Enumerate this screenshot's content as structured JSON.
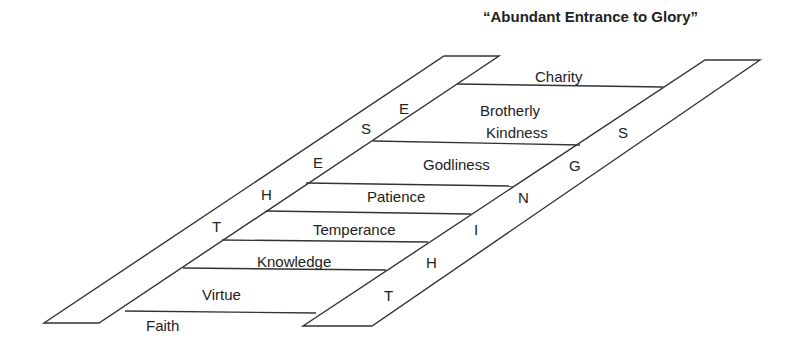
{
  "title": "“Abundant Entrance to Glory”",
  "rungs": {
    "faith": "Faith",
    "virtue": "Virtue",
    "knowledge": "Knowledge",
    "temperance": "Temperance",
    "patience": "Patience",
    "godliness": "Godliness",
    "brotherly_1": "Brotherly",
    "brotherly_2": "Kindness",
    "charity": "Charity"
  },
  "left_rail_letters": [
    "T",
    "H",
    "E",
    "S",
    "E"
  ],
  "right_rail_letters": [
    "T",
    "H",
    "I",
    "N",
    "G",
    "S"
  ],
  "colors": {
    "line": "#333333",
    "text": "#222222",
    "background": "#ffffff"
  }
}
